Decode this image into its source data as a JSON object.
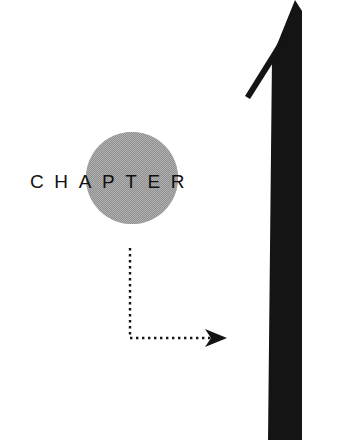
{
  "page": {
    "width": 342,
    "height": 440,
    "background_color": "#ffffff",
    "kind": "book-chapter-opener-illustration"
  },
  "wordmark": {
    "text": "CHAPTER",
    "color": "#111111",
    "font_size_px": 19,
    "letter_spacing_px": 10.6,
    "baseline_y": 192,
    "start_x": 32,
    "end_x": 222
  },
  "circle": {
    "name": "gray-halftone-circle",
    "fill_color": "#9a9a9a",
    "center_x": 132,
    "center_y": 178,
    "radius": 46
  },
  "big_arrow": {
    "name": "large-upward-arrow",
    "fill_color": "#141414",
    "tip_x": 295,
    "tip_y": 0,
    "shaft_left_top_x": 272,
    "shaft_left_bottom_x": 268,
    "shaft_right_x": 302,
    "bottom_y": 440,
    "barb_end_x": 246,
    "barb_end_y": 97,
    "barb_width_px": 5
  },
  "dotted_path": {
    "name": "dotted-elbow-connector",
    "color": "#141414",
    "dot_size_px": 2.4,
    "dot_pitch_px": 6,
    "vertical_x": 130,
    "vertical_start_y": 248,
    "vertical_end_y": 338,
    "horizontal_y": 338,
    "horizontal_start_x": 130,
    "horizontal_end_x": 214,
    "arrowhead": {
      "name": "small-right-arrowhead",
      "tip_x": 227,
      "tip_y": 338,
      "back_x": 206,
      "half_height": 9,
      "notch_depth": 6
    }
  }
}
